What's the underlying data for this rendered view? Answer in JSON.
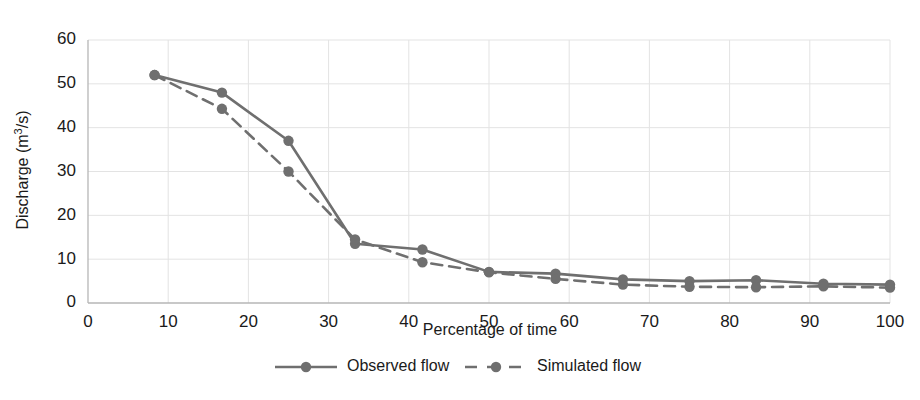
{
  "chart_data": {
    "type": "line",
    "title": "",
    "xlabel": "Percentage of time",
    "ylabel": "Discharge (m3/s)",
    "ylabel_display": "Discharge (m³/s)",
    "xlim": [
      0,
      100
    ],
    "ylim": [
      0,
      60
    ],
    "xticks": [
      0,
      10,
      20,
      30,
      40,
      50,
      60,
      70,
      80,
      90,
      100
    ],
    "yticks": [
      0,
      10,
      20,
      30,
      40,
      50,
      60
    ],
    "grid": true,
    "legend_position": "bottom",
    "x": [
      8.3,
      16.7,
      25,
      33.3,
      41.7,
      50,
      58.3,
      66.7,
      75,
      83.3,
      91.7,
      100
    ],
    "series": [
      {
        "name": "Observed flow",
        "style": "solid",
        "marker": "circle",
        "color": "#6f6f6f",
        "values": [
          52,
          48,
          37,
          13.5,
          12.2,
          7.1,
          6.7,
          5.4,
          5,
          5.2,
          4.4,
          4.2
        ]
      },
      {
        "name": "Simulated flow",
        "style": "dashed",
        "marker": "circle",
        "color": "#6f6f6f",
        "values": [
          52,
          44.3,
          30,
          14.5,
          9.3,
          7,
          5.5,
          4.2,
          3.7,
          3.6,
          3.8,
          3.5
        ]
      }
    ]
  },
  "legend": {
    "items": [
      {
        "label": "Observed flow",
        "style": "solid"
      },
      {
        "label": "Simulated flow",
        "style": "dashed"
      }
    ]
  },
  "axes": {
    "x_title": "Percentage of time",
    "y_title": "Discharge (m³/s)",
    "y_title_main": "Discharge (m",
    "y_title_sup": "3",
    "y_title_tail": "/s)"
  },
  "colors": {
    "series": "#6f6f6f",
    "grid": "#e3e3e3",
    "axis": "#b6b6b6",
    "text": "#1a1a1a",
    "background": "#ffffff"
  }
}
